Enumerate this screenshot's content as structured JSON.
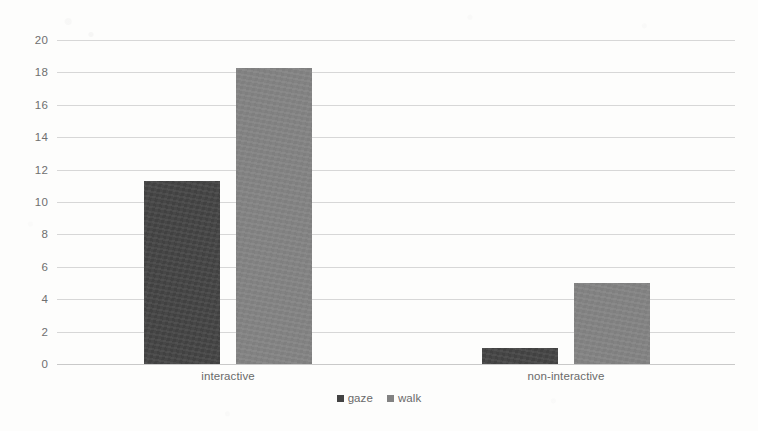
{
  "chart_data": {
    "type": "bar",
    "title": "",
    "subtitle": "",
    "xlabel": "",
    "ylabel": "",
    "categories": [
      "interactive",
      "non-interactive"
    ],
    "series": [
      {
        "name": "gaze",
        "color": "#434343",
        "values": [
          11.3,
          1.0
        ]
      },
      {
        "name": "walk",
        "color": "#828282",
        "values": [
          18.3,
          5.0
        ]
      }
    ],
    "ylim": [
      0,
      20
    ],
    "ytick_step": 2,
    "ytick_labels": [
      "20",
      "18",
      "16",
      "14",
      "12",
      "10",
      "8",
      "6",
      "4",
      "2",
      "0"
    ],
    "grid": true,
    "grid_axis": "y",
    "legend_position": "bottom",
    "background_color": "#fdfdfc",
    "gridline_color": "#d7d7d7",
    "tick_label_color": "#6f6f6f"
  },
  "axis": {
    "y_ticks": [
      {
        "value": 20,
        "label": "20"
      },
      {
        "value": 18,
        "label": "18"
      },
      {
        "value": 16,
        "label": "16"
      },
      {
        "value": 14,
        "label": "14"
      },
      {
        "value": 12,
        "label": "12"
      },
      {
        "value": 10,
        "label": "10"
      },
      {
        "value": 8,
        "label": "8"
      },
      {
        "value": 6,
        "label": "6"
      },
      {
        "value": 4,
        "label": "4"
      },
      {
        "value": 2,
        "label": "2"
      },
      {
        "value": 0,
        "label": "0"
      }
    ]
  },
  "legend": {
    "entries": [
      {
        "label": "gaze",
        "marker": "square-marker-icon"
      },
      {
        "label": "walk",
        "marker": "square-marker-icon"
      }
    ]
  }
}
